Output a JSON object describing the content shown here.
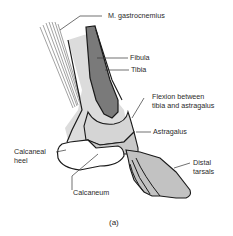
{
  "figure": {
    "caption": "(a)",
    "labels": {
      "gastrocnemius": "M. gastrocnemius",
      "fibula": "Fibula",
      "tibia": "Tibia",
      "flexion_line1": "Flexion between",
      "flexion_line2": "tibia and astragalus",
      "astragalus": "Astragalus",
      "calcaneal_heel_line1": "Calcaneal",
      "calcaneal_heel_line2": "heel",
      "calcaneum": "Calcaneum",
      "distal_tarsals_line1": "Distal",
      "distal_tarsals_line2": "tarsals"
    },
    "colors": {
      "outline": "#1a1a1a",
      "light_fill": "#dcdcdc",
      "mid_fill": "#bdbdbd",
      "dark_fill": "#7a7a7a",
      "muscle_lines": "#8a8a8a",
      "leader_lines": "#333333"
    }
  }
}
